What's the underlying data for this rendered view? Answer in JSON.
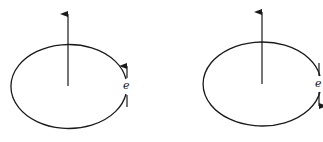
{
  "figure": {
    "panels": [
      {
        "id": "left",
        "orbit_label": "e",
        "electron_direction": "up",
        "axis_arrow": "up"
      },
      {
        "id": "right",
        "orbit_label": "e",
        "electron_direction": "down",
        "axis_arrow": "up"
      }
    ],
    "stroke_color": "#1a1a1a",
    "background": "#ffffff"
  }
}
